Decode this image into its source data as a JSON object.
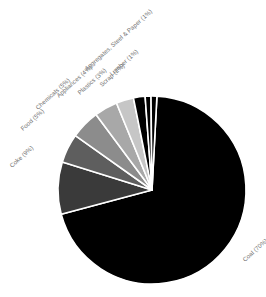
{
  "chart_data": {
    "type": "pie",
    "title": "",
    "subtitle": "",
    "xlabel": "",
    "ylabel": "",
    "legend_position": "none",
    "grid": false,
    "labels_placement": "outside-rotated",
    "unit": "%",
    "total": 100,
    "categories": [
      "Coal",
      "Coke",
      "Food",
      "Chemicals",
      "Appliances",
      "Plastics",
      "Scrap",
      "Lumber",
      "Aggregates, Steel & Paper"
    ],
    "values": [
      70,
      9,
      5,
      5,
      4,
      3,
      2,
      1,
      1
    ],
    "labels": [
      "Coal (70%)",
      "Coke (9%)",
      "Food (5%)",
      "Chemicals (5%)",
      "Appliances (4%)",
      "Plastics (3%)",
      "Scrap (2%)",
      "Lumber (1%)",
      "Aggregates, Steel & Paper (1%)"
    ],
    "colors": [
      "#000000",
      "#3a3a3a",
      "#5e5e5e",
      "#8c8c8c",
      "#a8a8a8",
      "#c6c6c6",
      "#000000",
      "#000000",
      "#000000"
    ],
    "slice_separator_color": "#ffffff",
    "background_color": "#ffffff",
    "label_color": "#6f6f6f",
    "start_angle_deg": 3,
    "direction": "clockwise",
    "center_x": 152,
    "center_y": 190,
    "radius": 94,
    "label_rotation_deg": -42,
    "label_offsets": [
      {
        "name": "Coal (70%)",
        "x": 245,
        "y": 262,
        "rotate": -42,
        "anchor": "start"
      },
      {
        "name": "Coke (9%)",
        "x": 12,
        "y": 168,
        "rotate": -42,
        "anchor": "start"
      },
      {
        "name": "Food (5%)",
        "x": 23,
        "y": 131,
        "rotate": -42,
        "anchor": "start"
      },
      {
        "name": "Chemicals (5%)",
        "x": 38,
        "y": 110,
        "rotate": -42,
        "anchor": "start"
      },
      {
        "name": "Appliances (4%)",
        "x": 59,
        "y": 98,
        "rotate": -42,
        "anchor": "start"
      },
      {
        "name": "Plastics (3%)",
        "x": 80,
        "y": 95,
        "rotate": -42,
        "anchor": "start"
      },
      {
        "name": "Scrap (2%)",
        "x": 102,
        "y": 87,
        "rotate": -42,
        "anchor": "start"
      },
      {
        "name": "Lumber (1%)",
        "x": 112,
        "y": 76,
        "rotate": -42,
        "anchor": "start"
      },
      {
        "name": "Aggregates, Steel & Paper (1%)",
        "x": 87,
        "y": 71,
        "rotate": -42,
        "anchor": "start"
      }
    ]
  }
}
